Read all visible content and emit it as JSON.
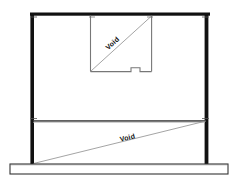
{
  "drawing": {
    "title": "Structural Elevation",
    "background_color": "#ffffff",
    "ink_color": "#111111",
    "thin_line_color": "#8a8a8a",
    "hatch_color": "#a8a8a8",
    "labels": {
      "upper_void": "Void",
      "lower_void": "Void"
    },
    "geometry": {
      "canvas": {
        "width": 238,
        "height": 181
      },
      "left_column": {
        "x": 30,
        "y_top": 12,
        "y_bottom": 164,
        "thickness": 4
      },
      "right_column": {
        "x": 208,
        "y_top": 12,
        "y_bottom": 164,
        "thickness": 4
      },
      "top_beam": {
        "x_left": 30,
        "x_right": 210,
        "y": 13,
        "thickness": 3
      },
      "mid_beam": {
        "x_left": 32,
        "x_right": 209,
        "y": 121,
        "thickness": 1.6
      },
      "base_slab": {
        "x_left": 10,
        "x_right": 228,
        "y_top": 164,
        "y_bottom": 174
      },
      "upper_void_box": {
        "x_left": 90,
        "x_right": 152,
        "y_top": 15,
        "y_bottom": 72,
        "notch": {
          "x_start": 131,
          "x_end": 140,
          "y_offset": 4
        }
      },
      "upper_diagonal": {
        "x1": 91,
        "y1": 71,
        "x2": 151,
        "y2": 16
      },
      "lower_diagonal": {
        "x1": 33,
        "y1": 163,
        "x2": 207,
        "y2": 121
      }
    },
    "corner_ticks": [
      {
        "x": 33,
        "y": 16
      },
      {
        "x": 205,
        "y": 16
      },
      {
        "x": 33,
        "y": 119
      },
      {
        "x": 205,
        "y": 119
      },
      {
        "x": 92,
        "y": 17
      },
      {
        "x": 150,
        "y": 17
      }
    ]
  }
}
